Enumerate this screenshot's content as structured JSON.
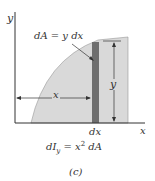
{
  "figure": {
    "axis_labels": {
      "y": "y",
      "x": "x"
    },
    "element_label": "dA = y dx",
    "dimension_labels": {
      "x": "x",
      "y": "y",
      "dx": "dx"
    },
    "equation": {
      "lhs_d": "dI",
      "lhs_sub": "y",
      "rhs_x": "x",
      "rhs_exp": "2",
      "rhs_dA": " dA",
      "eq": " = "
    },
    "caption": "(c)",
    "colors": {
      "region_fill": "#d9d9d9",
      "strip_fill": "#6e6e6e",
      "axis": "#333333",
      "text": "#333333"
    }
  }
}
